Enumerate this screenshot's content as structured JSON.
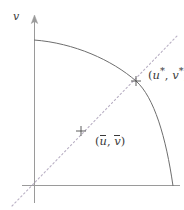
{
  "figure": {
    "background_color": "#ffffff",
    "width": 184,
    "height": 210,
    "axes": {
      "vertical_label": "v",
      "vertical_arrow": true,
      "horizontal_arrow": false,
      "color": "#9a9a9a",
      "origin": {
        "x": 34,
        "y": 185
      }
    },
    "curve": {
      "name": "frontier-curve",
      "color": "#6e6e6e",
      "style": "solid",
      "start": {
        "x": 34,
        "y": 40
      },
      "end": {
        "x": 173,
        "y": 186
      }
    },
    "diagonal": {
      "name": "diagonal-ray",
      "color": "#b9b0c4",
      "style": "dotted",
      "start": {
        "x": 12,
        "y": 206
      },
      "end": {
        "x": 177,
        "y": 36
      }
    },
    "markers": [
      {
        "name": "optimum-marker",
        "glyph": "+",
        "x": 136,
        "y": 81,
        "color": "#4a4a4a"
      },
      {
        "name": "mean-marker",
        "glyph": "+",
        "x": 81,
        "y": 131,
        "color": "#4a4a4a"
      }
    ],
    "labels": {
      "axis_v": "v",
      "optimum": {
        "open": "(",
        "first": "u",
        "first_sup": "*",
        "comma": ", ",
        "second": "v",
        "second_sup": "*",
        "close": ")"
      },
      "mean": {
        "open": "(",
        "first": "u",
        "comma": ", ",
        "second": "v",
        "close": ")"
      }
    }
  }
}
